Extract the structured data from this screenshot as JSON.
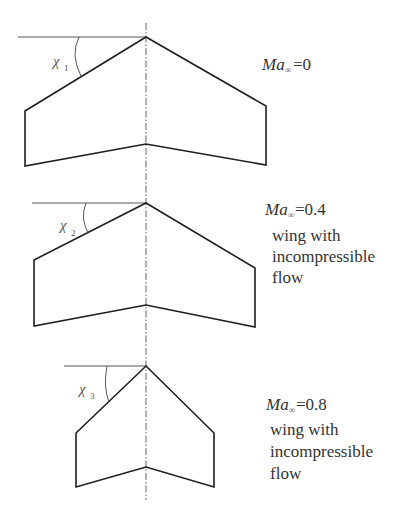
{
  "diagram": {
    "panels": [
      {
        "sweep_symbol": "χ",
        "sweep_subscript": "1",
        "mach_prefix": "Ma",
        "mach_subscript": "∞",
        "mach_value": "=0",
        "desc_lines": []
      },
      {
        "sweep_symbol": "χ",
        "sweep_subscript": "2",
        "mach_prefix": "Ma",
        "mach_subscript": "∞",
        "mach_value": "=0.4",
        "desc_lines": [
          "wing with",
          "incompressible",
          "flow"
        ]
      },
      {
        "sweep_symbol": "χ",
        "sweep_subscript": "3",
        "mach_prefix": "Ma",
        "mach_subscript": "∞",
        "mach_value": "=0.8",
        "desc_lines": [
          "wing with",
          "incompressible",
          "flow"
        ]
      }
    ]
  }
}
